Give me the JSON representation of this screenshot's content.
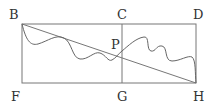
{
  "diagram": {
    "labels": {
      "B": "B",
      "C": "C",
      "D": "D",
      "P": "P",
      "F": "F",
      "G": "G",
      "H": "H"
    },
    "points": {
      "B": [
        22,
        24
      ],
      "C": [
        122,
        24
      ],
      "D": [
        196,
        24
      ],
      "F": [
        22,
        83
      ],
      "G": [
        122,
        83
      ],
      "H": [
        196,
        83
      ],
      "P": [
        122,
        51
      ]
    },
    "elements": [
      "rectangle BDHF",
      "segment CG",
      "segment BH",
      "wavy curve B to H through P"
    ]
  }
}
